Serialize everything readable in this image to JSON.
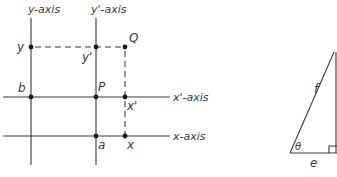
{
  "diagram": {
    "coordinate_frames": {
      "axes": [
        {
          "id": "y-axis",
          "label": "y-axis"
        },
        {
          "id": "y-prime-axis",
          "label": "y'-axis"
        },
        {
          "id": "x-prime-axis",
          "label": "x'-axis"
        },
        {
          "id": "x-axis",
          "label": "x-axis"
        }
      ],
      "points": [
        {
          "id": "y",
          "label": "y"
        },
        {
          "id": "y-prime",
          "label": "y'"
        },
        {
          "id": "Q",
          "label": "Q"
        },
        {
          "id": "b",
          "label": "b"
        },
        {
          "id": "P",
          "label": "P"
        },
        {
          "id": "x-prime",
          "label": "x'"
        },
        {
          "id": "a",
          "label": "a"
        },
        {
          "id": "x",
          "label": "x"
        }
      ]
    },
    "triangle": {
      "hypotenuse_label": "f",
      "base_label": "e",
      "angle_label": "θ",
      "right_angle": true
    }
  }
}
